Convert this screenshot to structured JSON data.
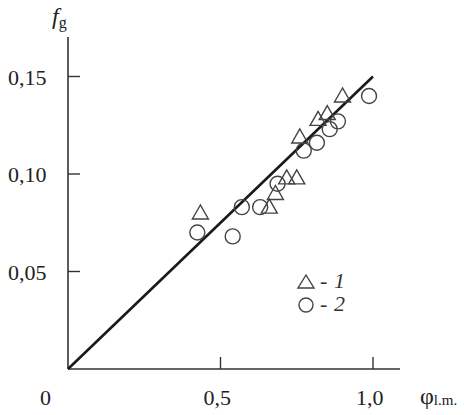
{
  "chart_data": {
    "type": "scatter",
    "title": "",
    "xlabel": "φ",
    "xlabel_sub": "l.m.",
    "ylabel": "f",
    "ylabel_sub": "g",
    "xlim": [
      0,
      1.08
    ],
    "ylim": [
      0,
      0.17
    ],
    "origin_label": "0",
    "x_ticks": [
      {
        "value": 0.5,
        "label": "0,5"
      },
      {
        "value": 1.0,
        "label": "1,0"
      }
    ],
    "y_ticks": [
      {
        "value": 0.05,
        "label": "0,05"
      },
      {
        "value": 0.1,
        "label": "0,10"
      },
      {
        "value": 0.15,
        "label": "0,15"
      }
    ],
    "grid": false,
    "legend_position": "lower right",
    "series": [
      {
        "name": "1",
        "marker": "triangle",
        "x": [
          0.434,
          0.66,
          0.68,
          0.717,
          0.75,
          0.76,
          0.82,
          0.85,
          0.9
        ],
        "y": [
          0.08,
          0.083,
          0.09,
          0.098,
          0.098,
          0.119,
          0.128,
          0.131,
          0.14
        ]
      },
      {
        "name": "2",
        "marker": "circle",
        "x": [
          0.424,
          0.54,
          0.57,
          0.63,
          0.687,
          0.773,
          0.816,
          0.858,
          0.885,
          0.987
        ],
        "y": [
          0.07,
          0.068,
          0.083,
          0.083,
          0.095,
          0.112,
          0.116,
          0.123,
          0.127,
          0.14
        ]
      }
    ],
    "fit_line": {
      "x": [
        0,
        1.0
      ],
      "y": [
        0,
        0.15
      ]
    }
  },
  "legend": {
    "items": [
      {
        "marker": "triangle",
        "dash": "-",
        "label": "1"
      },
      {
        "marker": "circle",
        "dash": "-",
        "label": "2"
      }
    ]
  }
}
